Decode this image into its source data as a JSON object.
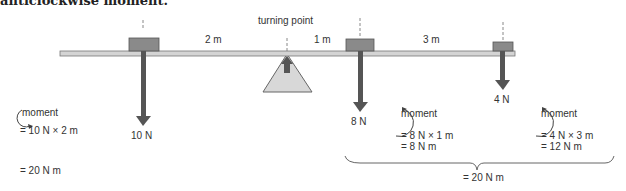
{
  "heading": "anticlockwise moment.",
  "diagram": {
    "pivot_label": "turning point",
    "distances": {
      "left": "2 m",
      "mid": "1 m",
      "right": "3 m"
    },
    "forces": {
      "left": "10 N",
      "mid": "8 N",
      "right": "4 N"
    },
    "left_moment": {
      "label": "moment",
      "line1": "= 10 N × 2 m",
      "line2": "= 20 N m"
    },
    "mid_moment": {
      "label": "moment",
      "line1": "= 8 N × 1 m",
      "line2": "= 8 N m"
    },
    "right_moment": {
      "label": "moment",
      "line1": "= 4 N × 3 m",
      "line2": "= 12 N m"
    },
    "total": "= 20 N m",
    "colors": {
      "beam": "#d4d4d4",
      "weight": "#8a8a8a",
      "arrow": "#555555",
      "pivot": "#d8d8d8"
    }
  }
}
